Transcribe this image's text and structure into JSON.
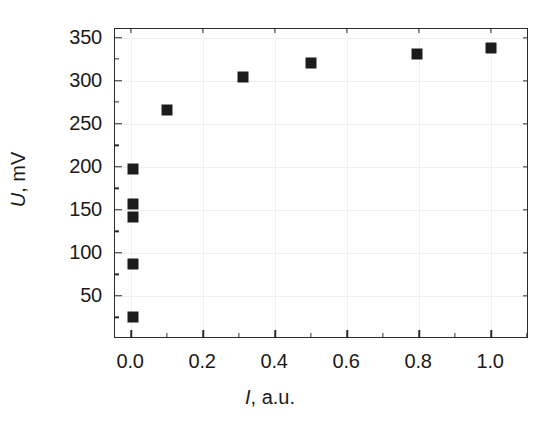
{
  "chart_data": {
    "type": "scatter",
    "title": "",
    "xlabel": "I, a.u.",
    "xlabel_symbol": "I",
    "xlabel_unit": ", a.u.",
    "ylabel": "U, mV",
    "ylabel_symbol": "U",
    "ylabel_unit": ", mV",
    "xlim": [
      -0.045,
      1.105
    ],
    "ylim": [
      0,
      360
    ],
    "xticks": [
      0.0,
      0.2,
      0.4,
      0.6,
      0.8,
      1.0
    ],
    "xticklabels": [
      "0.0",
      "0.2",
      "0.4",
      "0.6",
      "0.8",
      "1.0"
    ],
    "xminorticks": [
      0.1,
      0.3,
      0.5,
      0.7,
      0.9,
      1.1
    ],
    "yticks": [
      50,
      100,
      150,
      200,
      250,
      300,
      350
    ],
    "yticklabels": [
      "50",
      "100",
      "150",
      "200",
      "250",
      "300",
      "350"
    ],
    "yminorticks": [
      25,
      75,
      125,
      175,
      225,
      275,
      325
    ],
    "grid": true,
    "legend": "none",
    "marker": "square",
    "marker_color": "#1c1c1c",
    "series": [
      {
        "name": "U vs I",
        "points": [
          {
            "x": 0.005,
            "y": 25
          },
          {
            "x": 0.005,
            "y": 87
          },
          {
            "x": 0.005,
            "y": 142
          },
          {
            "x": 0.005,
            "y": 157
          },
          {
            "x": 0.005,
            "y": 197
          },
          {
            "x": 0.1,
            "y": 266
          },
          {
            "x": 0.31,
            "y": 304
          },
          {
            "x": 0.5,
            "y": 321
          },
          {
            "x": 0.795,
            "y": 331
          },
          {
            "x": 1.0,
            "y": 338
          }
        ]
      }
    ]
  },
  "figure": {
    "background_color": "#ffffff",
    "frame_color": "#2b2b2b",
    "grid_color": "#f0f0f0"
  }
}
